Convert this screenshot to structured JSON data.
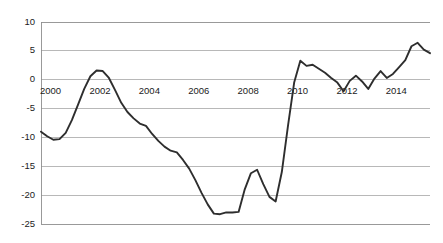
{
  "chart_data": {
    "type": "line",
    "title": "",
    "subtitle": "",
    "xlabel": "",
    "ylabel": "",
    "xlim": [
      2000.0,
      2015.75
    ],
    "ylim": [
      -25,
      10
    ],
    "ytick_values": [
      10,
      5,
      0,
      -5,
      -10,
      -15,
      -20,
      -25
    ],
    "ytick_labels": [
      "10",
      "5",
      "0",
      "-5",
      "-10",
      "-15",
      "-20",
      "-25"
    ],
    "xtick_values": [
      2000,
      2002,
      2004,
      2006,
      2008,
      2010,
      2012,
      2014
    ],
    "xtick_labels": [
      "2000",
      "2002",
      "2004",
      "2006",
      "2008",
      "2010",
      "2012",
      "2014"
    ],
    "grid": "horizontal",
    "legend": "none",
    "series": [
      {
        "name": "series-1",
        "color": "#2e2e2e",
        "x": [
          2000.0,
          2000.25,
          2000.5,
          2000.75,
          2001.0,
          2001.25,
          2001.5,
          2001.75,
          2002.0,
          2002.25,
          2002.5,
          2002.75,
          2003.0,
          2003.25,
          2003.5,
          2003.75,
          2004.0,
          2004.25,
          2004.5,
          2004.75,
          2005.0,
          2005.25,
          2005.5,
          2005.75,
          2006.0,
          2006.25,
          2006.5,
          2006.75,
          2007.0,
          2007.25,
          2007.5,
          2007.75,
          2008.0,
          2008.25,
          2008.5,
          2008.75,
          2009.0,
          2009.25,
          2009.5,
          2009.75,
          2010.0,
          2010.25,
          2010.5,
          2010.75,
          2011.0,
          2011.25,
          2011.5,
          2011.75,
          2012.0,
          2012.25,
          2012.5,
          2012.75,
          2013.0,
          2013.25,
          2013.5,
          2013.75,
          2014.0,
          2014.25,
          2014.5,
          2014.75,
          2015.0,
          2015.25,
          2015.5,
          2015.75
        ],
        "values": [
          -9.0,
          -9.8,
          -10.4,
          -10.3,
          -9.2,
          -7.0,
          -4.3,
          -1.6,
          0.6,
          1.6,
          1.5,
          0.3,
          -1.8,
          -4.0,
          -5.6,
          -6.7,
          -7.6,
          -8.0,
          -9.4,
          -10.6,
          -11.6,
          -12.3,
          -12.6,
          -13.9,
          -15.4,
          -17.4,
          -19.6,
          -21.6,
          -23.2,
          -23.3,
          -23.0,
          -23.0,
          -22.9,
          -19.0,
          -16.2,
          -15.6,
          -18.1,
          -20.3,
          -21.1,
          -16.0,
          -8.0,
          -0.5,
          3.3,
          2.4,
          2.6,
          1.9,
          1.2,
          0.3,
          -0.5,
          -2.0,
          -0.2,
          0.7,
          -0.3,
          -1.6,
          0.2,
          1.5,
          0.3,
          1.0,
          2.2,
          3.4,
          5.8,
          6.4,
          5.2,
          4.6
        ]
      }
    ],
    "series_extra": {
      "name": "series-1-continued",
      "x": [
        2013.0,
        2013.25,
        2013.5,
        2013.75,
        2014.0,
        2014.25,
        2014.5,
        2014.75,
        2015.0,
        2015.25,
        2015.5,
        2015.75
      ],
      "values": [
        6.4,
        5.2,
        4.6,
        5.9,
        5.2,
        4.4,
        5.6,
        6.4,
        5.1,
        4.5,
        5.3,
        5.2
      ]
    }
  },
  "axis": {
    "y_axis_name": "y-axis",
    "x_axis_name": "x-axis"
  }
}
